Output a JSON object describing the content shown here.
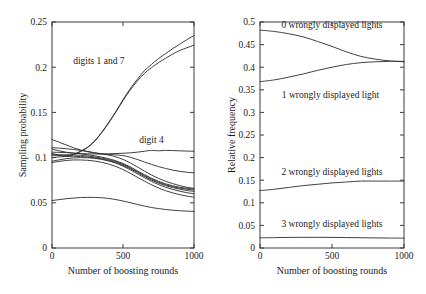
{
  "figure": {
    "background": "#ffffff",
    "line_color": "#2b2b2b",
    "axis_color": "#3a3a3a"
  },
  "chart_data": [
    {
      "id": "left-panel",
      "type": "line",
      "title": "",
      "xlabel": "Number of boosting rounds",
      "ylabel": "Sampling probability",
      "xlim": [
        0,
        1000
      ],
      "ylim": [
        0,
        0.25
      ],
      "xticks": [
        0,
        500,
        1000
      ],
      "xticklabels": [
        "0",
        "500",
        "1000"
      ],
      "yticks": [
        0,
        0.05,
        0.1,
        0.15,
        0.2,
        0.25
      ],
      "yticklabels": [
        "0",
        "0.05",
        "0.1",
        "0.15",
        "0.2",
        "0.25"
      ],
      "grid": false,
      "legend": "none",
      "annotations": [
        {
          "text": "digits 1 and 7",
          "x": 330,
          "y": 0.203
        },
        {
          "text": "digit 4",
          "x": 700,
          "y": 0.116
        }
      ],
      "x": [
        0,
        50,
        100,
        150,
        200,
        250,
        300,
        350,
        400,
        450,
        500,
        550,
        600,
        650,
        700,
        750,
        800,
        850,
        900,
        950,
        1000
      ],
      "series": [
        {
          "name": "digit 1",
          "values": [
            0.1045,
            0.103,
            0.1025,
            0.1035,
            0.107,
            0.1115,
            0.1185,
            0.128,
            0.139,
            0.151,
            0.164,
            0.176,
            0.1865,
            0.196,
            0.203,
            0.2095,
            0.215,
            0.2205,
            0.2255,
            0.2305,
            0.235
          ]
        },
        {
          "name": "digit 7",
          "values": [
            0.1035,
            0.1025,
            0.102,
            0.103,
            0.1065,
            0.111,
            0.118,
            0.1275,
            0.1385,
            0.1505,
            0.163,
            0.1745,
            0.1845,
            0.193,
            0.1995,
            0.205,
            0.21,
            0.2145,
            0.2185,
            0.2215,
            0.2245
          ]
        },
        {
          "name": "digit 4",
          "values": [
            0.1095,
            0.1075,
            0.106,
            0.105,
            0.1045,
            0.1042,
            0.104,
            0.104,
            0.1042,
            0.1045,
            0.1048,
            0.1052,
            0.106,
            0.107,
            0.108,
            0.1075,
            0.108,
            0.1078,
            0.1075,
            0.1072,
            0.107
          ]
        },
        {
          "name": "digit a",
          "values": [
            0.12,
            0.117,
            0.114,
            0.111,
            0.1085,
            0.1065,
            0.105,
            0.104,
            0.1035,
            0.103,
            0.1022,
            0.1005,
            0.098,
            0.0952,
            0.0925,
            0.09,
            0.088,
            0.0862,
            0.0848,
            0.0838,
            0.0832
          ]
        },
        {
          "name": "digit b",
          "values": [
            0.111,
            0.1105,
            0.1098,
            0.109,
            0.108,
            0.1068,
            0.1055,
            0.1042,
            0.1028,
            0.1008,
            0.098,
            0.0942,
            0.0898,
            0.0852,
            0.0808,
            0.077,
            0.0738,
            0.0712,
            0.069,
            0.0672,
            0.066
          ]
        },
        {
          "name": "digit c",
          "values": [
            0.106,
            0.1058,
            0.1055,
            0.105,
            0.1042,
            0.1032,
            0.102,
            0.1005,
            0.0988,
            0.0965,
            0.0935,
            0.0898,
            0.0855,
            0.0812,
            0.0772,
            0.0738,
            0.071,
            0.0688,
            0.0672,
            0.066,
            0.0652
          ]
        },
        {
          "name": "digit d",
          "values": [
            0.1025,
            0.1028,
            0.103,
            0.103,
            0.1025,
            0.1018,
            0.1008,
            0.0995,
            0.0978,
            0.0955,
            0.0925,
            0.0888,
            0.0845,
            0.0802,
            0.0762,
            0.0728,
            0.07,
            0.0678,
            0.0662,
            0.065,
            0.0642
          ]
        },
        {
          "name": "digit e",
          "values": [
            0.1,
            0.1008,
            0.1012,
            0.1014,
            0.1012,
            0.1006,
            0.0998,
            0.0985,
            0.0968,
            0.0946,
            0.0916,
            0.0878,
            0.0835,
            0.0792,
            0.0752,
            0.0718,
            0.069,
            0.0668,
            0.065,
            0.0636,
            0.0626
          ]
        },
        {
          "name": "digit f",
          "values": [
            0.096,
            0.0975,
            0.0988,
            0.0996,
            0.1,
            0.0998,
            0.0992,
            0.098,
            0.0962,
            0.0938,
            0.0906,
            0.0866,
            0.0822,
            0.0778,
            0.0738,
            0.0702,
            0.0672,
            0.0648,
            0.0628,
            0.0612,
            0.06
          ]
        },
        {
          "name": "digit g",
          "values": [
            0.0945,
            0.0958,
            0.0968,
            0.0974,
            0.0974,
            0.097,
            0.0962,
            0.0948,
            0.0928,
            0.0902,
            0.0868,
            0.0828,
            0.0784,
            0.074,
            0.07,
            0.0664,
            0.0634,
            0.061,
            0.059,
            0.0574,
            0.0562
          ]
        },
        {
          "name": "digit h",
          "values": [
            0.0525,
            0.0535,
            0.0545,
            0.0552,
            0.0558,
            0.056,
            0.056,
            0.0556,
            0.0548,
            0.0536,
            0.052,
            0.0502,
            0.0482,
            0.0464,
            0.0448,
            0.0436,
            0.0426,
            0.0418,
            0.0412,
            0.0408,
            0.0405
          ]
        }
      ]
    },
    {
      "id": "right-panel",
      "type": "line",
      "title": "",
      "xlabel": "Number of boosting rounds",
      "ylabel": "Relative frequency",
      "xlim": [
        0,
        1000
      ],
      "ylim": [
        0,
        0.5
      ],
      "xticks": [
        0,
        500,
        1000
      ],
      "xticklabels": [
        "0",
        "500",
        "1000"
      ],
      "yticks": [
        0,
        0.05,
        0.1,
        0.15,
        0.2,
        0.25,
        0.3,
        0.35,
        0.4,
        0.45,
        0.5
      ],
      "yticklabels": [
        "0",
        "0.05",
        "0.1",
        "0.15",
        "0.2",
        "0.25",
        "0.3",
        "0.35",
        "0.4",
        "0.45",
        "0.5"
      ],
      "grid": false,
      "legend": "none",
      "annotations": [
        {
          "text": "0 wrongly displayed lights",
          "x": 500,
          "y": 0.487
        },
        {
          "text": "1 wrongly displayed light",
          "x": 490,
          "y": 0.332
        },
        {
          "text": "2 wrongly displayed lights",
          "x": 500,
          "y": 0.162
        },
        {
          "text": "3 wrongly displayed lights",
          "x": 500,
          "y": 0.047
        }
      ],
      "x": [
        0,
        100,
        200,
        300,
        400,
        500,
        600,
        700,
        800,
        900,
        1000
      ],
      "series": [
        {
          "name": "0 wrongly displayed lights",
          "values": [
            0.482,
            0.479,
            0.474,
            0.467,
            0.457,
            0.446,
            0.434,
            0.424,
            0.418,
            0.414,
            0.412
          ]
        },
        {
          "name": "1 wrongly displayed light",
          "values": [
            0.368,
            0.372,
            0.378,
            0.385,
            0.393,
            0.4,
            0.406,
            0.41,
            0.412,
            0.413,
            0.413
          ]
        },
        {
          "name": "2 wrongly displayed lights",
          "values": [
            0.127,
            0.13,
            0.134,
            0.138,
            0.141,
            0.144,
            0.146,
            0.148,
            0.148,
            0.148,
            0.148
          ]
        },
        {
          "name": "3 wrongly displayed lights",
          "values": [
            0.0225,
            0.023,
            0.0234,
            0.0236,
            0.0236,
            0.0234,
            0.0231,
            0.0227,
            0.0223,
            0.022,
            0.0218
          ]
        }
      ]
    }
  ]
}
